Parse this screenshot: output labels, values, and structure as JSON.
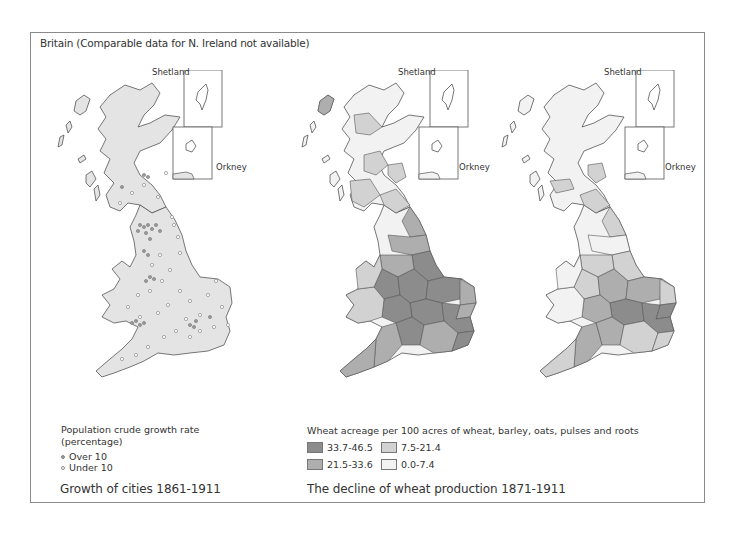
{
  "title": "Britain  (Comparable data for N. Ireland not available)",
  "maps": [
    {
      "id": "growth-of-cities",
      "caption": "Growth of cities 1861-1911",
      "inset_labels": {
        "shetland": "Shetland",
        "orkney": "Orkney"
      },
      "legend": {
        "title_line1": "Population crude growth rate",
        "title_line2": "(percentage)",
        "items": [
          {
            "symbol": "filled-dot",
            "label": "Over 10"
          },
          {
            "symbol": "hollow-dot",
            "label": "Under 10"
          }
        ]
      }
    },
    {
      "id": "wheat-1871",
      "caption": "The decline of wheat production 1871-1911",
      "inset_labels": {
        "shetland": "Shetland",
        "orkney": "Orkney"
      },
      "legend": {
        "title": "Wheat acreage per 100 acres of wheat, barley, oats, pulses and roots",
        "items": [
          {
            "range": "33.7-46.5",
            "color": "#8c8c8c"
          },
          {
            "range": "7.5-21.4",
            "color": "#d2d2d2"
          },
          {
            "range": "21.5-33.6",
            "color": "#aeaeae"
          },
          {
            "range": "0.0-7.4",
            "color": "#f2f2f2"
          }
        ]
      }
    },
    {
      "id": "wheat-1911",
      "inset_labels": {
        "shetland": "Shetland",
        "orkney": "Orkney"
      }
    }
  ],
  "colors": {
    "land": "#e4e4e4",
    "outline": "#555555",
    "frame": "#8a8a8a",
    "class_high": "#8c8c8c",
    "class_midhigh": "#aeaeae",
    "class_midlow": "#d2d2d2",
    "class_low": "#f2f2f2"
  }
}
